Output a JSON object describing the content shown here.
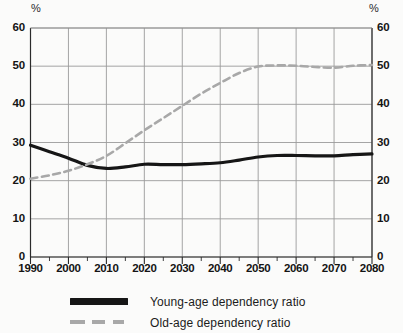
{
  "chart_data": {
    "type": "line",
    "title": "",
    "subtitle": "",
    "xlabel": "",
    "ylabel": "%",
    "ylabel_right": "%",
    "xlim": [
      1990,
      2080
    ],
    "ylim": [
      0,
      60
    ],
    "grid": true,
    "legend_position": "bottom",
    "y_ticks": [
      0,
      10,
      20,
      30,
      40,
      50,
      60
    ],
    "y_tick_labels": [
      "0",
      "10",
      "20",
      "30",
      "40",
      "50",
      "60"
    ],
    "y_ticks_right": [
      0,
      10,
      20,
      30,
      40,
      50,
      60
    ],
    "y_tick_labels_right": [
      "0",
      "10",
      "20",
      "30",
      "40",
      "50",
      "60"
    ],
    "x_ticks": [
      1990,
      2000,
      2010,
      2020,
      2030,
      2040,
      2050,
      2060,
      2070,
      2080
    ],
    "x_tick_labels": [
      "1990",
      "2000",
      "2010",
      "2020",
      "2030",
      "2040",
      "2050",
      "2060",
      "2070",
      "2080"
    ],
    "x_minor_tick_interval": 5,
    "x": [
      1990,
      1995,
      2000,
      2005,
      2010,
      2015,
      2020,
      2025,
      2030,
      2035,
      2040,
      2045,
      2050,
      2055,
      2060,
      2065,
      2070,
      2075,
      2080
    ],
    "series": [
      {
        "name": "Young-age dependency ratio",
        "style": "solid",
        "color": "#161616",
        "width": 3.2,
        "values": [
          29.3,
          27.6,
          25.9,
          24.0,
          23.2,
          23.6,
          24.3,
          24.2,
          24.2,
          24.4,
          24.7,
          25.4,
          26.2,
          26.6,
          26.6,
          26.5,
          26.5,
          26.8,
          27.0
        ]
      },
      {
        "name": "Old-age dependency ratio",
        "style": "dashed",
        "color": "#a8a8a8",
        "width": 2.6,
        "values": [
          20.5,
          21.4,
          22.6,
          24.3,
          26.5,
          29.8,
          33.2,
          36.4,
          39.6,
          42.8,
          45.6,
          48.2,
          49.9,
          50.2,
          50.1,
          49.8,
          49.6,
          50.1,
          50.3
        ]
      }
    ]
  },
  "legend": {
    "items": [
      {
        "label": "Young-age dependency ratio",
        "style": "solid",
        "color": "#161616"
      },
      {
        "label": "Old-age dependency ratio",
        "style": "dashed",
        "color": "#a8a8a8"
      }
    ]
  }
}
